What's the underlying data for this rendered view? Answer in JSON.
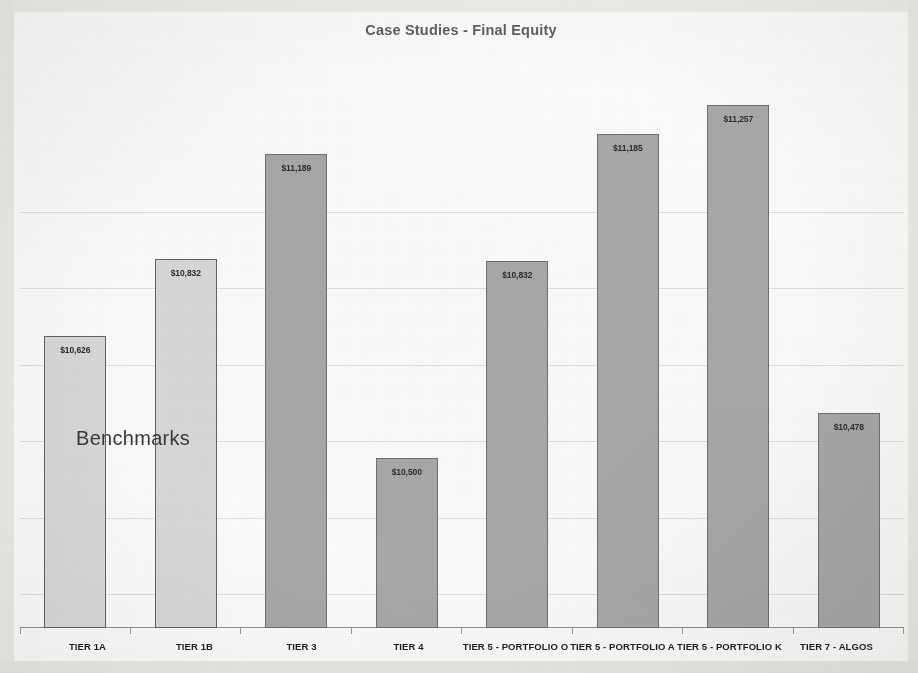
{
  "chart": {
    "title": "Case Studies - Final Equity",
    "annotation": "Benchmarks"
  },
  "chart_data": {
    "type": "bar",
    "title": "Case Studies - Final Equity",
    "xlabel": "",
    "ylabel": "",
    "ylim": [
      10000,
      11400
    ],
    "grid": true,
    "legend": false,
    "annotations": [
      "Benchmarks"
    ],
    "categories": [
      "TIER 1A",
      "TIER 1B",
      "TIER 3",
      "TIER 4",
      "TIER 5 - PORTFOLIO O",
      "TIER 5 - PORTFOLIO A",
      "TIER 5 - PORTFOLIO K",
      "TIER 7 - ALGOS"
    ],
    "values": [
      10626,
      10832,
      11189,
      10500,
      10832,
      11185,
      11257,
      10478
    ],
    "value_labels": [
      "$10,626",
      "$10,832",
      "$11,189",
      "$10,500",
      "$10,832",
      "$11,185",
      "$11,257",
      "$10,478"
    ],
    "bar_styles": [
      "light",
      "light",
      "dark",
      "dark",
      "dark",
      "dark",
      "dark",
      "dark"
    ],
    "colors": {
      "bar_light": "#d8d8d8",
      "bar_dark": "#a8a8a8",
      "bar_border": "#6f6f6f",
      "gridline": "#dedede",
      "axis": "#8f8f8f",
      "title_text": "#5f5f5f",
      "label_text": "#2b2b2b",
      "plot_background": "#fbfbfa"
    },
    "bar_heights_px": [
      292,
      369,
      474,
      170,
      367,
      494,
      523,
      215
    ],
    "gridlines_px": [
      152,
      228,
      305,
      381,
      458,
      534
    ]
  }
}
